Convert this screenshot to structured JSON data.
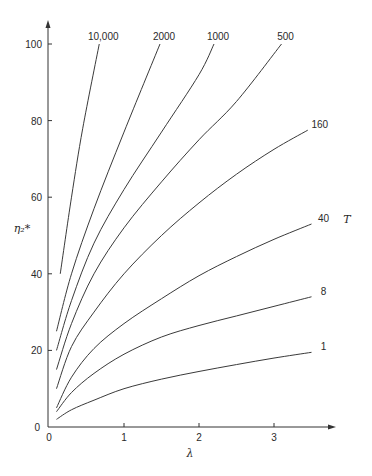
{
  "chart_data": {
    "type": "line",
    "title": "",
    "xlabel": "λ",
    "ylabel": "η₂*",
    "legend_title": "T",
    "xlim": [
      0,
      3.6
    ],
    "ylim": [
      0,
      100
    ],
    "x_ticks": [
      0,
      1,
      2,
      3
    ],
    "y_ticks": [
      0,
      20,
      40,
      60,
      80,
      100
    ],
    "x_tick_labels": [
      "0",
      "1",
      "2",
      "3"
    ],
    "y_tick_labels": [
      "0",
      "20",
      "40",
      "60",
      "80",
      "100"
    ],
    "grid": false,
    "series": [
      {
        "name": "1",
        "label": "1",
        "x": [
          0.1,
          0.3,
          0.6,
          1.0,
          1.5,
          2.0,
          2.5,
          3.0,
          3.5
        ],
        "y": [
          2,
          4.5,
          7,
          10,
          12.5,
          14.5,
          16.3,
          18,
          19.5
        ]
      },
      {
        "name": "8",
        "label": "8",
        "x": [
          0.1,
          0.3,
          0.6,
          1.0,
          1.5,
          2.0,
          2.5,
          3.0,
          3.5
        ],
        "y": [
          4,
          9,
          14,
          19,
          23.5,
          26.5,
          29,
          31.5,
          34
        ]
      },
      {
        "name": "40",
        "label": "40",
        "x": [
          0.1,
          0.3,
          0.6,
          1.0,
          1.5,
          2.0,
          2.5,
          3.0,
          3.5
        ],
        "y": [
          5,
          13,
          20.5,
          27,
          33.5,
          39.5,
          44.5,
          49,
          53
        ]
      },
      {
        "name": "160",
        "label": "160",
        "x": [
          0.1,
          0.3,
          0.6,
          1.0,
          1.5,
          2.0,
          2.5,
          3.0,
          3.45
        ],
        "y": [
          10,
          21,
          30,
          40,
          50,
          58.5,
          66,
          72.5,
          77.5
        ]
      },
      {
        "name": "500",
        "label": "500",
        "x": [
          0.1,
          0.3,
          0.6,
          1.0,
          1.5,
          2.0,
          2.5,
          3.1
        ],
        "y": [
          15,
          27,
          40,
          52,
          64,
          75,
          85,
          100
        ]
      },
      {
        "name": "1000",
        "label": "1000",
        "x": [
          0.1,
          0.3,
          0.6,
          1.0,
          1.5,
          2.0,
          2.2
        ],
        "y": [
          20,
          33,
          48,
          62,
          77,
          92,
          100
        ]
      },
      {
        "name": "2000",
        "label": "2000",
        "x": [
          0.1,
          0.3,
          0.6,
          1.0,
          1.48
        ],
        "y": [
          25,
          40,
          57,
          77,
          100
        ]
      },
      {
        "name": "10,000",
        "label": "10,000",
        "x": [
          0.15,
          0.3,
          0.45,
          0.67
        ],
        "y": [
          40,
          60,
          78,
          100
        ]
      }
    ],
    "legend_position": "curve-end labels"
  }
}
